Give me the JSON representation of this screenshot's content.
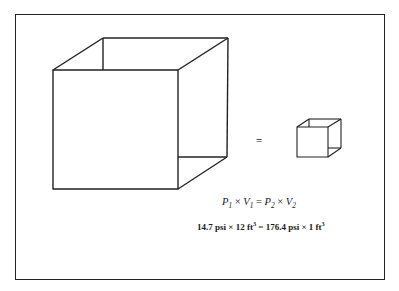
{
  "figure": {
    "equals_sign": "=",
    "formula_symbolic": {
      "p1": "P",
      "p1_sub": "1",
      "times1": " × ",
      "v1": "V",
      "v1_sub": "1",
      "eq": " = ",
      "p2": "P",
      "p2_sub": "2",
      "times2": " × ",
      "v2": "V",
      "v2_sub": "2"
    },
    "formula_numeric": {
      "left_pressure": "14.7 psi",
      "times1": " × ",
      "left_volume": "12 ft",
      "left_volume_exp": "3",
      "eq": " = ",
      "right_pressure": "176.4 psi",
      "times2": " × ",
      "right_volume": "1 ft",
      "right_volume_exp": "3"
    },
    "colors": {
      "line": "#222222",
      "background": "#ffffff"
    }
  }
}
